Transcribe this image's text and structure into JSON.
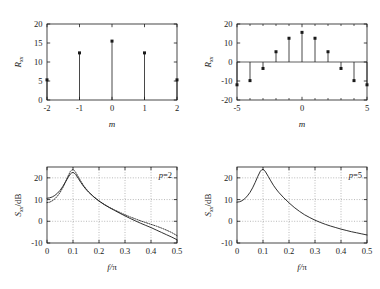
{
  "figure": {
    "background": "#ffffff",
    "ink": "#1a1a1a",
    "grid_color": "#8a8a8a"
  },
  "chart_data": [
    {
      "id": "top-left",
      "type": "stem",
      "title": "",
      "xlabel": "m",
      "ylabel": "R",
      "ylabel_sub": "xx",
      "x": [
        -2,
        -1,
        0,
        1,
        2
      ],
      "values": [
        5.3,
        12.4,
        15.5,
        12.4,
        5.3
      ],
      "xlim": [
        -2,
        2
      ],
      "ylim": [
        0,
        20
      ],
      "xticks": [
        -2,
        -1,
        0,
        1,
        2
      ],
      "xticklabels": [
        "-2",
        "-1",
        "0",
        "1",
        "2"
      ],
      "yticks": [
        0,
        5,
        10,
        15,
        20
      ],
      "yticklabels": [
        "0",
        "5",
        "10",
        "15",
        "20"
      ],
      "grid": false,
      "baseline": 0,
      "annotation": ""
    },
    {
      "id": "top-right",
      "type": "stem",
      "title": "",
      "xlabel": "m",
      "ylabel": "R",
      "ylabel_sub": "xx",
      "x": [
        -5,
        -4,
        -3,
        -2,
        -1,
        0,
        1,
        2,
        3,
        4,
        5
      ],
      "values": [
        -12.0,
        -9.8,
        -3.4,
        5.4,
        12.5,
        15.6,
        12.5,
        5.4,
        -3.4,
        -9.8,
        -12.0
      ],
      "xlim": [
        -5,
        5
      ],
      "ylim": [
        -20,
        20
      ],
      "xticks": [
        -5,
        0,
        5
      ],
      "xticklabels": [
        "-5",
        "0",
        "5"
      ],
      "xminorticks": [
        -4,
        -3,
        -2,
        -1,
        1,
        2,
        3,
        4
      ],
      "yticks": [
        -20,
        -10,
        0,
        10,
        20
      ],
      "yticklabels": [
        "-20",
        "-10",
        "0",
        "10",
        "20"
      ],
      "grid": false,
      "baseline": 0,
      "annotation": ""
    },
    {
      "id": "bottom-left",
      "type": "line",
      "title": "",
      "xlabel": "f/π",
      "ylabel": "S",
      "ylabel_sub": "xx",
      "ylabel_tail": "/dB",
      "xlim": [
        0,
        0.5
      ],
      "ylim": [
        -10,
        25
      ],
      "xticks": [
        0,
        0.1,
        0.2,
        0.3,
        0.4,
        0.5
      ],
      "xticklabels": [
        "0",
        "0.1",
        "0.2",
        "0.3",
        "0.4",
        "0.5"
      ],
      "yticks": [
        -10,
        0,
        10,
        20
      ],
      "yticklabels": [
        "-10",
        "0",
        "10",
        "20"
      ],
      "grid": true,
      "annotation": "p=2",
      "series": [
        {
          "name": "estimate",
          "style": "solid",
          "x": [
            0,
            0.01,
            0.02,
            0.03,
            0.04,
            0.05,
            0.06,
            0.07,
            0.08,
            0.09,
            0.095,
            0.1,
            0.105,
            0.11,
            0.12,
            0.13,
            0.14,
            0.15,
            0.16,
            0.18,
            0.2,
            0.22,
            0.24,
            0.26,
            0.28,
            0.3,
            0.32,
            0.34,
            0.36,
            0.38,
            0.4,
            0.42,
            0.44,
            0.46,
            0.48,
            0.5
          ],
          "y": [
            10.6,
            10.8,
            11.2,
            11.9,
            12.9,
            14.2,
            15.9,
            17.9,
            20.0,
            21.8,
            22.3,
            22.5,
            22.2,
            21.6,
            19.8,
            17.9,
            16.2,
            14.7,
            13.4,
            11.2,
            9.3,
            7.7,
            6.3,
            5.0,
            3.7,
            2.5,
            1.3,
            0.2,
            -0.9,
            -1.9,
            -2.9,
            -4.0,
            -5.1,
            -6.2,
            -7.3,
            -8.5
          ]
        },
        {
          "name": "true",
          "style": "dotted",
          "x": [
            0,
            0.01,
            0.02,
            0.03,
            0.04,
            0.05,
            0.06,
            0.07,
            0.08,
            0.09,
            0.095,
            0.1,
            0.105,
            0.11,
            0.12,
            0.13,
            0.14,
            0.15,
            0.16,
            0.18,
            0.2,
            0.22,
            0.24,
            0.26,
            0.28,
            0.3,
            0.32,
            0.34,
            0.36,
            0.38,
            0.4,
            0.42,
            0.44,
            0.46,
            0.48,
            0.5
          ],
          "y": [
            8.6,
            8.8,
            9.4,
            10.3,
            11.6,
            13.2,
            15.3,
            17.8,
            20.6,
            23.0,
            23.6,
            23.8,
            23.4,
            22.6,
            20.6,
            18.5,
            16.6,
            15.0,
            13.6,
            11.3,
            9.4,
            7.8,
            6.4,
            5.2,
            4.1,
            3.0,
            2.0,
            1.1,
            0.2,
            -0.6,
            -1.4,
            -2.2,
            -3.1,
            -4.1,
            -5.2,
            -6.6
          ]
        }
      ]
    },
    {
      "id": "bottom-right",
      "type": "line",
      "title": "",
      "xlabel": "f/π",
      "ylabel": "S",
      "ylabel_sub": "xx",
      "ylabel_tail": "/dB",
      "xlim": [
        0,
        0.5
      ],
      "ylim": [
        -10,
        25
      ],
      "xticks": [
        0,
        0.1,
        0.2,
        0.3,
        0.4,
        0.5
      ],
      "xticklabels": [
        "0",
        "0.1",
        "0.2",
        "0.3",
        "0.4",
        "0.5"
      ],
      "yticks": [
        -10,
        0,
        10,
        20
      ],
      "yticklabels": [
        "-10",
        "0",
        "10",
        "20"
      ],
      "grid": true,
      "annotation": "p=5",
      "series": [
        {
          "name": "estimate",
          "style": "solid",
          "x": [
            0,
            0.01,
            0.02,
            0.03,
            0.04,
            0.05,
            0.06,
            0.07,
            0.08,
            0.09,
            0.095,
            0.1,
            0.105,
            0.11,
            0.12,
            0.13,
            0.14,
            0.15,
            0.16,
            0.18,
            0.2,
            0.22,
            0.24,
            0.26,
            0.28,
            0.3,
            0.32,
            0.34,
            0.36,
            0.38,
            0.4,
            0.42,
            0.44,
            0.46,
            0.48,
            0.5
          ],
          "y": [
            8.8,
            9.0,
            9.5,
            10.4,
            11.7,
            13.3,
            15.4,
            17.9,
            20.7,
            23.1,
            23.7,
            23.9,
            23.5,
            22.7,
            20.7,
            18.6,
            16.6,
            14.9,
            13.4,
            10.8,
            8.5,
            6.4,
            4.6,
            3.0,
            1.7,
            0.5,
            -0.5,
            -1.4,
            -2.2,
            -2.9,
            -3.6,
            -4.2,
            -4.8,
            -5.3,
            -5.8,
            -6.3
          ]
        }
      ]
    }
  ]
}
